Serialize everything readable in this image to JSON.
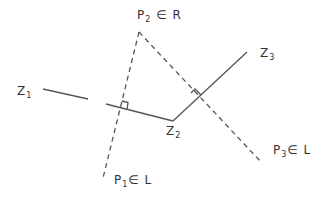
{
  "diagram": {
    "labels": {
      "z1": {
        "main": "Z",
        "sub": "1"
      },
      "z2": {
        "main": "Z",
        "sub": "2"
      },
      "z3": {
        "main": "Z",
        "sub": "3"
      },
      "p2": {
        "main": "P",
        "sub": "2",
        "rest": " ∈ R"
      },
      "p1": {
        "main": "P",
        "sub": "1",
        "rest": "∈ L"
      },
      "p3": {
        "main": "P",
        "sub": "3",
        "rest": "∈ L"
      }
    },
    "points": {
      "z1_start": [
        43,
        89
      ],
      "gap_a": [
        88,
        99
      ],
      "gap_b": [
        106,
        104
      ],
      "z2": [
        173,
        121
      ],
      "z3_end": [
        247,
        52
      ],
      "p2_apex": [
        139,
        32
      ],
      "p1_end": [
        103,
        178
      ],
      "p3_end": [
        262,
        163
      ]
    },
    "colors": {
      "stroke": "#555555",
      "text": "#333333"
    }
  }
}
